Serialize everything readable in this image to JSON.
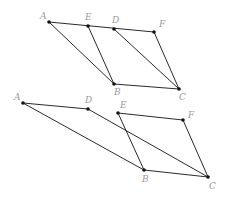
{
  "diagram": {
    "figures": [
      {
        "id": "top",
        "points": {
          "A": {
            "label": "A",
            "x": 49,
            "y": 22
          },
          "E": {
            "label": "E",
            "x": 88,
            "y": 26
          },
          "D": {
            "label": "D",
            "x": 114,
            "y": 29
          },
          "F": {
            "label": "F",
            "x": 154,
            "y": 32
          },
          "B": {
            "label": "B",
            "x": 114,
            "y": 84
          },
          "C": {
            "label": "C",
            "x": 179,
            "y": 89
          }
        },
        "segments": [
          [
            "A",
            "F"
          ],
          [
            "A",
            "B"
          ],
          [
            "E",
            "B"
          ],
          [
            "D",
            "C"
          ],
          [
            "F",
            "C"
          ],
          [
            "B",
            "C"
          ]
        ]
      },
      {
        "id": "bottom",
        "points": {
          "A": {
            "label": "A",
            "x": 23,
            "y": 103
          },
          "D": {
            "label": "D",
            "x": 88,
            "y": 109
          },
          "E": {
            "label": "E",
            "x": 118,
            "y": 113
          },
          "F": {
            "label": "F",
            "x": 183,
            "y": 120
          },
          "B": {
            "label": "B",
            "x": 144,
            "y": 170
          },
          "C": {
            "label": "C",
            "x": 208,
            "y": 177
          }
        },
        "segments": [
          [
            "A",
            "D"
          ],
          [
            "A",
            "B"
          ],
          [
            "D",
            "C"
          ],
          [
            "E",
            "F"
          ],
          [
            "E",
            "B"
          ],
          [
            "F",
            "C"
          ],
          [
            "B",
            "C"
          ]
        ]
      }
    ],
    "colors": {
      "line": "#2a2a2a",
      "point": "#111111",
      "label": "#9a9a9a"
    }
  }
}
